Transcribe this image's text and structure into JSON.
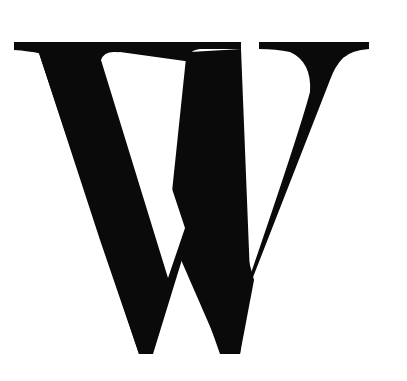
{
  "image": {
    "letter": "W",
    "foreground_color": "#0a0a0a",
    "background_color": "#ffffff"
  }
}
